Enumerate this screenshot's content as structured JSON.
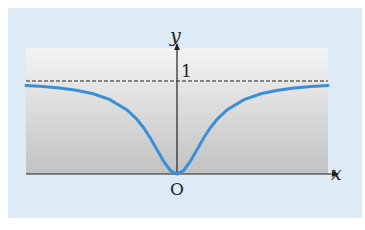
{
  "chart_data": {
    "type": "line",
    "title": "",
    "xlabel": "x",
    "ylabel": "y",
    "origin_label": "O",
    "y_tick_labels": [
      "1"
    ],
    "asymptote": {
      "y": 1,
      "style": "dashed"
    },
    "xlim": [
      -4.5,
      4.5
    ],
    "ylim": [
      0,
      1.3
    ],
    "function": "y = x^2 / (1 + x^2)",
    "series": [
      {
        "name": "curve",
        "color": "#3a8fd6",
        "x": [
          -4.5,
          -4,
          -3.5,
          -3,
          -2.5,
          -2,
          -1.5,
          -1.2,
          -1,
          -0.8,
          -0.6,
          -0.4,
          -0.2,
          0,
          0.2,
          0.4,
          0.6,
          0.8,
          1,
          1.2,
          1.5,
          2,
          2.5,
          3,
          3.5,
          4,
          4.5
        ],
        "values": [
          0.953,
          0.941,
          0.925,
          0.9,
          0.862,
          0.8,
          0.692,
          0.59,
          0.5,
          0.39,
          0.265,
          0.138,
          0.038,
          0,
          0.038,
          0.138,
          0.265,
          0.39,
          0.5,
          0.59,
          0.692,
          0.8,
          0.862,
          0.9,
          0.925,
          0.941,
          0.953
        ]
      }
    ],
    "grid": false,
    "legend": null
  },
  "colors": {
    "panel_bg": "#dcebf5",
    "plot_top": "#f4f4f4",
    "plot_bottom": "#c4c4c4",
    "axis": "#222222",
    "curve": "#3a8fd6"
  }
}
